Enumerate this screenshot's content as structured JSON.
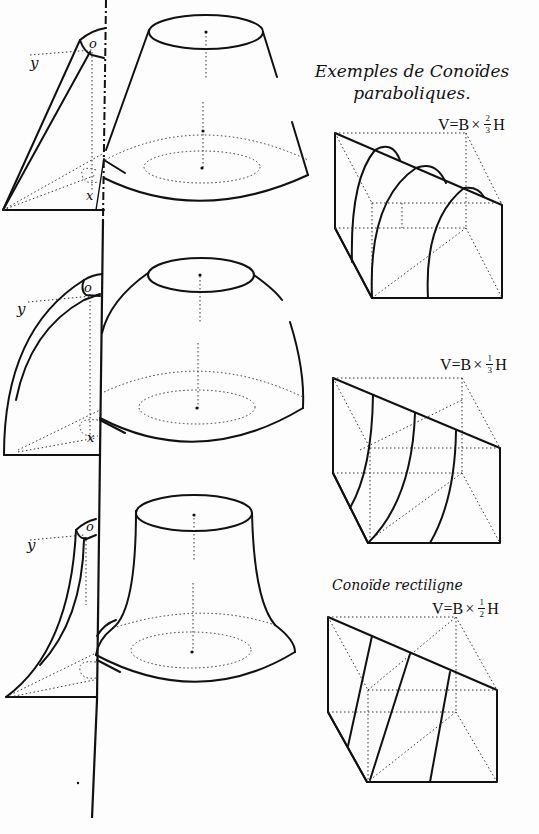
{
  "plate": {
    "title_line1": "Exemples de Conoïdes",
    "title_line2": "paraboliques.",
    "axis_labels": {
      "y": "y",
      "o": "o",
      "x": "x"
    }
  },
  "rows": [
    {
      "solid": "truncated-cone-like parabolic conoid",
      "profile_labels": {
        "y": "y",
        "o": "o",
        "x": "x"
      },
      "formula": {
        "lhs": "V=B",
        "op": "×",
        "num": "2",
        "den": "3",
        "rhs": "H"
      },
      "subtitle": ""
    },
    {
      "solid": "dome-shaped parabolic conoid",
      "profile_labels": {
        "y": "y",
        "o": "o",
        "x": "x"
      },
      "formula": {
        "lhs": "V=B",
        "op": "×",
        "num": "1",
        "den": "3",
        "rhs": "H"
      },
      "subtitle": ""
    },
    {
      "solid": "bell-shaped (flared) conoid",
      "profile_labels": {
        "y": "y",
        "o": "o",
        "x": ""
      },
      "formula": {
        "lhs": "V=B",
        "op": "×",
        "num": "1",
        "den": "2",
        "rhs": "H"
      },
      "subtitle": "Conoïde rectiligne"
    }
  ],
  "colors": {
    "ink": "#111111",
    "paper": "#fdfdfd"
  }
}
